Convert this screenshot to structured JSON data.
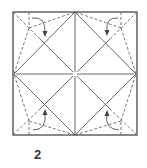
{
  "diagram": {
    "type": "origami-crease-pattern",
    "step_number": "2",
    "square": {
      "x1": 13,
      "y1": 12,
      "x2": 137,
      "y2": 135
    },
    "center": [
      75,
      74
    ],
    "colors": {
      "line": "#5a5a5a",
      "outline": "#4a4a4a",
      "background": "#ffffff"
    },
    "corner_arrows": [
      {
        "corner": "top-left",
        "direction": "down"
      },
      {
        "corner": "top-right",
        "direction": "down"
      },
      {
        "corner": "bottom-left",
        "direction": "up"
      },
      {
        "corner": "bottom-right",
        "direction": "up"
      }
    ]
  }
}
